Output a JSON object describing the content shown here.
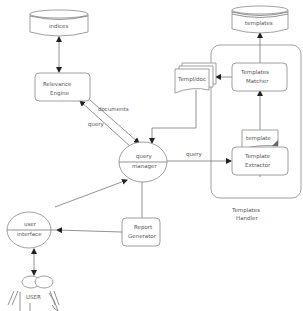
{
  "nodes": {
    "indices": "indices",
    "templates_db": "templates",
    "relevance_engine": [
      "Relevance",
      "Engine"
    ],
    "templates_matcher": [
      "Templates",
      "Matcher"
    ],
    "templ_doc": "Templ/doc",
    "template_doc": "template",
    "template_extractor": [
      "Template",
      "Extractor"
    ],
    "templates_handler": [
      "Templates",
      "Handler"
    ],
    "query_manager": [
      "query",
      "manager"
    ],
    "user_interface": [
      "user",
      "interface"
    ],
    "report_generator": [
      "Report",
      "Generator"
    ],
    "user": "USER"
  },
  "edges": {
    "documents": "documents",
    "query_to_engine": "query",
    "query_to_extractor": "query"
  }
}
